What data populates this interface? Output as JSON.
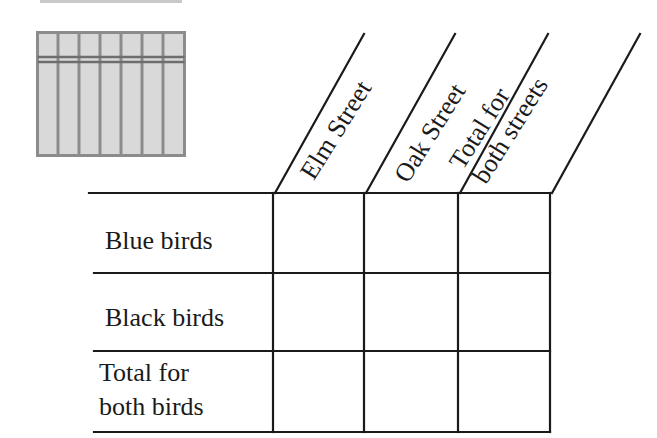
{
  "figure": {
    "icon": "bar-grid-icon",
    "colors": {
      "line": "#1a1a1a",
      "icon_fill": "#d9d9d9",
      "icon_stroke": "#8c8c8c"
    }
  },
  "table": {
    "columns": [
      {
        "label": "Elm Street"
      },
      {
        "label_line1": "Oak Street"
      },
      {
        "label_line1": "Total for",
        "label_line2": "both streets"
      }
    ],
    "rows": [
      {
        "label_line1": "Blue birds"
      },
      {
        "label_line1": "Black birds"
      },
      {
        "label_line1": "Total for",
        "label_line2": "both birds"
      }
    ],
    "cells": [
      [
        "",
        "",
        ""
      ],
      [
        "",
        "",
        ""
      ],
      [
        "",
        "",
        ""
      ]
    ]
  }
}
